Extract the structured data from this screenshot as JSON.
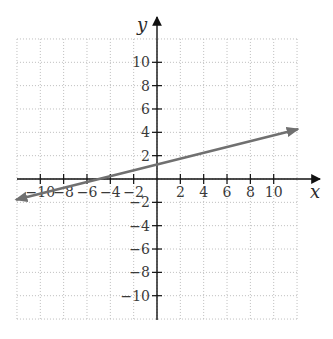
{
  "chart_data": {
    "type": "line",
    "title": "",
    "xlabel": "x",
    "ylabel": "y",
    "xlim": [
      -12,
      12
    ],
    "ylim": [
      -12,
      12
    ],
    "grid": true,
    "grid_step": 2,
    "x_ticks": [
      -10,
      -8,
      -6,
      -4,
      -2,
      2,
      4,
      6,
      8,
      10
    ],
    "y_ticks": [
      -10,
      -8,
      -6,
      -4,
      -2,
      2,
      4,
      6,
      8,
      10
    ],
    "x_tick_labels": [
      "−10",
      "−8",
      "−6",
      "−4",
      "−2",
      "2",
      "4",
      "6",
      "8",
      "10"
    ],
    "y_tick_labels": [
      "−10",
      "−8",
      "−6",
      "−4",
      "−2",
      "2",
      "4",
      "6",
      "8",
      "10"
    ],
    "series": [
      {
        "name": "line",
        "equation": "y = x/4 + 1.25",
        "x": [
          -12,
          12
        ],
        "y": [
          -1.75,
          4.25
        ],
        "arrows": "both",
        "color": "#707070"
      }
    ],
    "legend": null
  },
  "colors": {
    "axis": "#111111",
    "grid": "#bdbdbd",
    "line": "#707070"
  }
}
